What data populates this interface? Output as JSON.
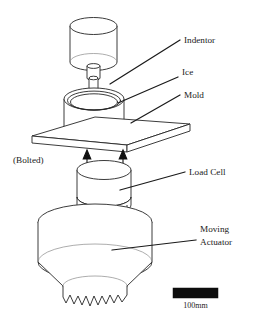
{
  "figure": {
    "background_color": "#ffffff",
    "line_color": "#262626"
  },
  "labels": {
    "indentor": "Indentor",
    "ice": "Ice",
    "mold": "Mold",
    "bolted": "(Bolted)",
    "load_cell": "Load Cell",
    "moving_actuator_line1": "Moving",
    "moving_actuator_line2": "Actuator"
  },
  "scale": {
    "caption": "100mm",
    "bar_color": "#0d0d0d"
  },
  "components": [
    {
      "name": "indentor",
      "label": "Indentor"
    },
    {
      "name": "ice",
      "label": "Ice"
    },
    {
      "name": "mold",
      "label": "Mold"
    },
    {
      "name": "base-plate",
      "label": "(Bolted)"
    },
    {
      "name": "load-cell",
      "label": "Load Cell"
    },
    {
      "name": "moving-actuator",
      "label": "Moving Actuator"
    }
  ]
}
